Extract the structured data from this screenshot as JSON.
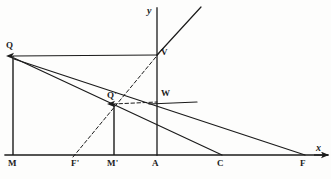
{
  "figure": {
    "background_color": "#fdfdfc",
    "ink_color": "#1b1b1b"
  },
  "axes": {
    "x_label": "x",
    "y_label": "y",
    "x_axis": {
      "x1": 5,
      "y1": 155,
      "x2": 328,
      "y2": 155
    },
    "y_axis": {
      "x1": 157,
      "y1": 8,
      "x2": 157,
      "y2": 155
    }
  },
  "points": [
    {
      "name": "Q",
      "label": "Q",
      "x": 13,
      "y": 56,
      "label_x": 6,
      "label_y": 41
    },
    {
      "name": "V",
      "label": "V",
      "x": 157,
      "y": 55,
      "label_x": 161,
      "label_y": 48
    },
    {
      "name": "Qp",
      "label": "Q'",
      "x": 113,
      "y": 105,
      "label_x": 107,
      "label_y": 91
    },
    {
      "name": "W",
      "label": "W",
      "x": 157,
      "y": 103,
      "label_x": 161,
      "label_y": 89
    },
    {
      "name": "M",
      "label": "M",
      "x": 13,
      "y": 155,
      "label_x": 8,
      "label_y": 159
    },
    {
      "name": "Fp",
      "label": "F'",
      "x": 77,
      "y": 155,
      "label_x": 71,
      "label_y": 159
    },
    {
      "name": "Mp",
      "label": "M'",
      "x": 114,
      "y": 155,
      "label_x": 107,
      "label_y": 159
    },
    {
      "name": "A",
      "label": "A",
      "x": 157,
      "y": 155,
      "label_x": 152,
      "label_y": 159
    },
    {
      "name": "C",
      "label": "C",
      "x": 222,
      "y": 155,
      "label_x": 217,
      "label_y": 159
    },
    {
      "name": "F",
      "label": "F",
      "x": 305,
      "y": 155,
      "label_x": 300,
      "label_y": 159
    }
  ],
  "segments": [
    {
      "name": "segment-QV",
      "style": "solid",
      "x1": 13,
      "y1": 56,
      "x2": 157,
      "y2": 55
    },
    {
      "name": "segment-QC",
      "style": "solid",
      "x1": 14,
      "y1": 58,
      "x2": 222,
      "y2": 155
    },
    {
      "name": "segment-QF",
      "style": "solid",
      "x1": 14,
      "y1": 59,
      "x2": 305,
      "y2": 155
    },
    {
      "name": "segment-V-upper",
      "style": "solid",
      "x1": 157,
      "y1": 55,
      "x2": 201,
      "y2": 7
    },
    {
      "name": "segment-W-horizontal",
      "style": "solid",
      "x1": 149,
      "y1": 104,
      "x2": 197,
      "y2": 102
    },
    {
      "name": "dashed-FpV",
      "style": "dashed",
      "x1": 73,
      "y1": 157,
      "x2": 165,
      "y2": 46
    },
    {
      "name": "dashed-QpW",
      "style": "dashed",
      "x1": 113,
      "y1": 104,
      "x2": 157,
      "y2": 102
    }
  ],
  "vectors": [
    {
      "name": "vector-MQ",
      "x1": 13,
      "y1": 155,
      "x2": 13,
      "y2": 56
    },
    {
      "name": "vector-MpQp",
      "x1": 114,
      "y1": 155,
      "x2": 114,
      "y2": 104
    }
  ]
}
